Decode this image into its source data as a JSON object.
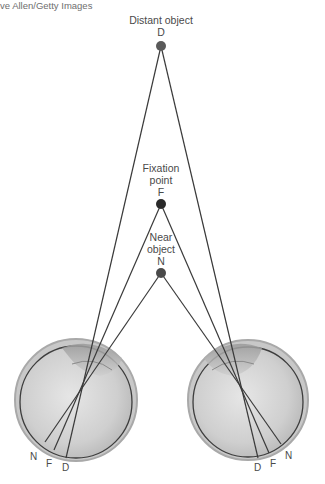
{
  "credit": "ve Allen/Getty Images",
  "objects": {
    "distant": {
      "label": "Distant object",
      "letter": "D"
    },
    "fixation": {
      "label_line1": "Fixation",
      "label_line2": "point",
      "letter": "F"
    },
    "near": {
      "label_line1": "Near",
      "label_line2": "object",
      "letter": "N"
    }
  },
  "left_eye": {
    "retina_labels": [
      "N",
      "F",
      "D"
    ]
  },
  "right_eye": {
    "retina_labels": [
      "D",
      "F",
      "N"
    ]
  },
  "colors": {
    "line": "#3a3a3a",
    "dot": "#2e2e2e",
    "text": "#4a4a4a",
    "eye_fill": "#d4d4d4"
  }
}
